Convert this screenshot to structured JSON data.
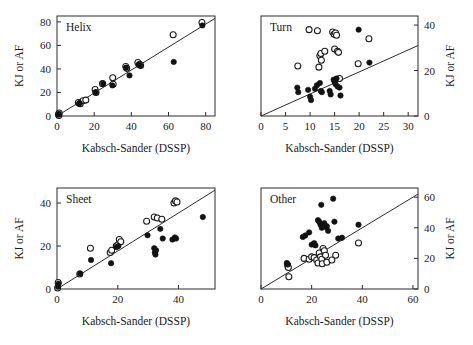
{
  "figure": {
    "panels": [
      {
        "key": "helix",
        "label": "Helix",
        "xlabel": "Kabsch-Sander (DSSP)",
        "ylabel": "KJ or AF",
        "y_axis_side": "left",
        "xlim": [
          0,
          85
        ],
        "ylim": [
          0,
          85
        ],
        "xticks": [
          0,
          20,
          40,
          60,
          80
        ],
        "yticks": [
          0,
          20,
          40,
          60,
          80
        ],
        "fit_line": {
          "x0": 0,
          "y0": 0,
          "x1": 85,
          "y1": 83
        }
      },
      {
        "key": "turn",
        "label": "Turn",
        "xlabel": "Kabsch-Sander (DSSP)",
        "ylabel": "KJ or AF",
        "y_axis_side": "right",
        "xlim": [
          0,
          32
        ],
        "ylim": [
          0,
          44
        ],
        "xticks": [
          0,
          5,
          10,
          15,
          20,
          25,
          30
        ],
        "yticks": [
          0,
          20,
          40
        ],
        "fit_line": {
          "x0": 0,
          "y0": 0,
          "x1": 32,
          "y1": 31
        }
      },
      {
        "key": "sheet",
        "label": "Sheet",
        "xlabel": "Kabsch-Sander (DSSP)",
        "ylabel": "KJ or AF",
        "y_axis_side": "left",
        "xlim": [
          0,
          52
        ],
        "ylim": [
          0,
          47
        ],
        "xticks": [
          0,
          20,
          40
        ],
        "yticks": [
          0,
          20,
          40
        ],
        "fit_line": {
          "x0": 0,
          "y0": 0,
          "x1": 52,
          "y1": 46
        }
      },
      {
        "key": "other",
        "label": "Other",
        "xlabel": "Kabsch-Sander (DSSP)",
        "ylabel": "KJ or AF",
        "y_axis_side": "right",
        "xlim": [
          0,
          62
        ],
        "ylim": [
          0,
          66
        ],
        "xticks": [
          0,
          20,
          40,
          60
        ],
        "yticks": [
          0,
          20,
          40,
          60
        ],
        "fit_line": {
          "x0": 0,
          "y0": 0,
          "x1": 62,
          "y1": 62
        }
      }
    ]
  },
  "chart_data": [
    {
      "type": "scatter",
      "title": "Helix",
      "xlabel": "Kabsch-Sander (DSSP)",
      "ylabel": "KJ or AF",
      "xlim": [
        0,
        85
      ],
      "ylim": [
        0,
        85
      ],
      "xticks": [
        0,
        20,
        40,
        60,
        80
      ],
      "yticks": [
        0,
        20,
        40,
        60,
        80
      ],
      "grid": false,
      "legend": "none",
      "reference_line": {
        "slope": 0.976,
        "intercept": 0,
        "label": "fit line"
      },
      "series": [
        {
          "name": "open-circles",
          "marker": "open-circle",
          "points": [
            [
              0.8,
              1.5
            ],
            [
              1.0,
              0.5
            ],
            [
              1.2,
              2.5
            ],
            [
              11.5,
              11.5
            ],
            [
              12.5,
              10.5
            ],
            [
              14.0,
              13.0
            ],
            [
              15.5,
              13.5
            ],
            [
              20.5,
              22.5
            ],
            [
              21.0,
              20.0
            ],
            [
              24.5,
              27.5
            ],
            [
              30.0,
              32.5
            ],
            [
              30.2,
              27.0
            ],
            [
              37.0,
              42.0
            ],
            [
              37.5,
              40.5
            ],
            [
              43.5,
              45.5
            ],
            [
              44.5,
              44.0
            ],
            [
              45.0,
              43.0
            ],
            [
              62.5,
              69.0
            ],
            [
              78.0,
              79.5
            ]
          ]
        },
        {
          "name": "filled-circles",
          "marker": "filled-circle",
          "points": [
            [
              0.8,
              1.0
            ],
            [
              1.0,
              2.0
            ],
            [
              11.8,
              10.5
            ],
            [
              12.2,
              11.0
            ],
            [
              20.8,
              20.0
            ],
            [
              24.8,
              27.5
            ],
            [
              29.8,
              26.0
            ],
            [
              37.2,
              41.0
            ],
            [
              39.0,
              34.5
            ],
            [
              43.8,
              43.5
            ],
            [
              44.8,
              43.0
            ],
            [
              62.8,
              46.0
            ],
            [
              78.2,
              77.0
            ]
          ]
        }
      ]
    },
    {
      "type": "scatter",
      "title": "Turn",
      "xlabel": "Kabsch-Sander (DSSP)",
      "ylabel": "KJ or AF",
      "xlim": [
        0,
        32
      ],
      "ylim": [
        0,
        44
      ],
      "xticks": [
        0,
        5,
        10,
        15,
        20,
        25,
        30
      ],
      "yticks": [
        0,
        20,
        40
      ],
      "grid": false,
      "legend": "none",
      "reference_line": {
        "slope": 0.97,
        "intercept": 0,
        "label": "fit line"
      },
      "series": [
        {
          "name": "open-circles",
          "marker": "open-circle",
          "points": [
            [
              7.5,
              22.0
            ],
            [
              9.8,
              38.0
            ],
            [
              11.5,
              37.5
            ],
            [
              11.8,
              21.5
            ],
            [
              12.0,
              26.5
            ],
            [
              12.2,
              27.5
            ],
            [
              12.3,
              24.5
            ],
            [
              13.0,
              28.5
            ],
            [
              14.6,
              37.0
            ],
            [
              14.9,
              36.0
            ],
            [
              15.2,
              36.5
            ],
            [
              15.4,
              35.5
            ],
            [
              15.0,
              29.5
            ],
            [
              15.6,
              28.5
            ],
            [
              15.8,
              28.0
            ],
            [
              16.0,
              16.5
            ],
            [
              19.8,
              23.0
            ],
            [
              22.0,
              34.0
            ]
          ]
        },
        {
          "name": "filled-circles",
          "marker": "filled-circle",
          "points": [
            [
              7.4,
              12.5
            ],
            [
              7.6,
              10.5
            ],
            [
              9.6,
              11.5
            ],
            [
              10.0,
              8.5
            ],
            [
              10.2,
              7.0
            ],
            [
              11.0,
              12.0
            ],
            [
              11.4,
              13.5
            ],
            [
              12.0,
              14.5
            ],
            [
              12.2,
              11.0
            ],
            [
              12.4,
              10.5
            ],
            [
              14.0,
              11.0
            ],
            [
              14.2,
              9.5
            ],
            [
              14.8,
              16.0
            ],
            [
              15.0,
              15.0
            ],
            [
              15.2,
              14.0
            ],
            [
              15.4,
              16.5
            ],
            [
              15.6,
              13.0
            ],
            [
              16.0,
              12.5
            ],
            [
              16.2,
              9.0
            ],
            [
              19.9,
              38.0
            ],
            [
              22.1,
              23.5
            ]
          ]
        }
      ]
    },
    {
      "type": "scatter",
      "title": "Sheet",
      "xlabel": "Kabsch-Sander (DSSP)",
      "ylabel": "KJ or AF",
      "xlim": [
        0,
        52
      ],
      "ylim": [
        0,
        47
      ],
      "xticks": [
        0,
        20,
        40
      ],
      "yticks": [
        0,
        20,
        40
      ],
      "grid": false,
      "legend": "none",
      "reference_line": {
        "slope": 0.885,
        "intercept": 0,
        "label": "fit line"
      },
      "series": [
        {
          "name": "open-circles",
          "marker": "open-circle",
          "points": [
            [
              0.2,
              0.5
            ],
            [
              0.4,
              3.0
            ],
            [
              7.5,
              7.0
            ],
            [
              11.0,
              19.0
            ],
            [
              17.5,
              17.0
            ],
            [
              18.0,
              18.0
            ],
            [
              19.5,
              20.0
            ],
            [
              20.0,
              20.5
            ],
            [
              20.5,
              23.0
            ],
            [
              21.0,
              22.0
            ],
            [
              29.5,
              31.5
            ],
            [
              32.0,
              33.5
            ],
            [
              33.0,
              33.0
            ],
            [
              34.5,
              32.5
            ],
            [
              38.5,
              40.0
            ],
            [
              39.0,
              41.0
            ],
            [
              39.5,
              40.5
            ]
          ]
        },
        {
          "name": "filled-circles",
          "marker": "filled-circle",
          "points": [
            [
              0.3,
              1.0
            ],
            [
              0.5,
              2.5
            ],
            [
              7.6,
              7.2
            ],
            [
              11.2,
              13.5
            ],
            [
              17.8,
              12.0
            ],
            [
              19.6,
              19.5
            ],
            [
              20.2,
              20.0
            ],
            [
              29.8,
              25.0
            ],
            [
              32.0,
              19.0
            ],
            [
              32.2,
              17.0
            ],
            [
              32.4,
              16.0
            ],
            [
              32.6,
              18.0
            ],
            [
              34.0,
              28.0
            ],
            [
              34.8,
              23.5
            ],
            [
              38.0,
              23.0
            ],
            [
              38.8,
              24.0
            ],
            [
              39.2,
              23.5
            ],
            [
              48.0,
              33.5
            ]
          ]
        }
      ]
    },
    {
      "type": "scatter",
      "title": "Other",
      "xlabel": "Kabsch-Sander (DSSP)",
      "ylabel": "KJ or AF",
      "xlim": [
        0,
        62
      ],
      "ylim": [
        0,
        66
      ],
      "xticks": [
        0,
        20,
        40,
        60
      ],
      "yticks": [
        0,
        20,
        40,
        60
      ],
      "grid": false,
      "legend": "none",
      "reference_line": {
        "slope": 1.0,
        "intercept": 0,
        "label": "fit line"
      },
      "series": [
        {
          "name": "open-circles",
          "marker": "open-circle",
          "points": [
            [
              10.5,
              15.5
            ],
            [
              10.8,
              14.0
            ],
            [
              11.0,
              8.0
            ],
            [
              17.0,
              20.0
            ],
            [
              19.0,
              19.5
            ],
            [
              20.0,
              21.0
            ],
            [
              21.0,
              20.5
            ],
            [
              22.0,
              19.0
            ],
            [
              22.5,
              17.0
            ],
            [
              23.0,
              23.5
            ],
            [
              23.5,
              21.0
            ],
            [
              24.0,
              19.5
            ],
            [
              24.2,
              16.5
            ],
            [
              24.5,
              26.5
            ],
            [
              25.0,
              25.0
            ],
            [
              25.5,
              22.0
            ],
            [
              26.0,
              17.5
            ],
            [
              28.0,
              19.0
            ],
            [
              29.5,
              22.0
            ],
            [
              38.5,
              30.0
            ]
          ]
        },
        {
          "name": "filled-circles",
          "marker": "filled-circle",
          "points": [
            [
              10.2,
              17.0
            ],
            [
              10.6,
              16.0
            ],
            [
              16.5,
              34.0
            ],
            [
              17.5,
              35.0
            ],
            [
              19.0,
              37.0
            ],
            [
              20.0,
              29.0
            ],
            [
              21.0,
              30.0
            ],
            [
              21.5,
              28.5
            ],
            [
              22.5,
              45.0
            ],
            [
              23.0,
              44.0
            ],
            [
              23.5,
              42.0
            ],
            [
              23.8,
              55.0
            ],
            [
              24.0,
              40.0
            ],
            [
              24.5,
              41.5
            ],
            [
              25.0,
              43.0
            ],
            [
              25.5,
              40.5
            ],
            [
              26.0,
              41.0
            ],
            [
              26.5,
              38.0
            ],
            [
              28.5,
              59.0
            ],
            [
              29.0,
              44.0
            ],
            [
              30.5,
              33.0
            ],
            [
              32.0,
              33.5
            ],
            [
              38.5,
              42.0
            ]
          ]
        }
      ]
    }
  ]
}
